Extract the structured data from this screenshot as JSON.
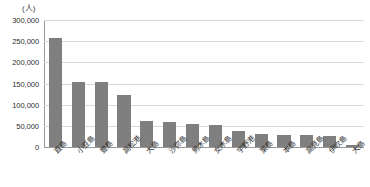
{
  "chart_data": {
    "type": "bar",
    "title": "",
    "subtitle": "",
    "unit_label": "(人)",
    "xlabel": "",
    "ylabel": "",
    "ylim": [
      0,
      300000
    ],
    "ytick_labels": [
      "300,000",
      "250,000",
      "200,000",
      "150,000",
      "100,000",
      "50,000",
      "0"
    ],
    "ytick_values": [
      300000,
      250000,
      200000,
      150000,
      100000,
      50000,
      0
    ],
    "grid": true,
    "legend": false,
    "legend_position": "none",
    "bar_color": "#7f7f7f",
    "gridline_color": "#d9d9d9",
    "axis_color": "#9a9a9a",
    "categories": [
      "直島",
      "小豆島",
      "豊島",
      "高松港",
      "大島",
      "沙弥島",
      "男木島",
      "女木島",
      "宇野港",
      "栗島",
      "本島",
      "高見島",
      "伊吹島",
      "大島"
    ],
    "values": [
      257000,
      154000,
      154000,
      123000,
      61000,
      60000,
      55000,
      52000,
      38000,
      31000,
      28000,
      28000,
      25000,
      5000
    ]
  }
}
